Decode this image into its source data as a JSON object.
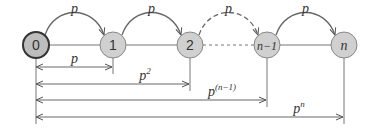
{
  "diagram": {
    "nodes": [
      {
        "id": "0",
        "label": "0",
        "x": 36,
        "y": 45,
        "fill": "#bdbdbd",
        "stroke": "#333333",
        "bold": true
      },
      {
        "id": "1",
        "label": "1",
        "x": 113,
        "y": 45,
        "fill": "#d0d0d0",
        "stroke": "#888888"
      },
      {
        "id": "2",
        "label": "2",
        "x": 190,
        "y": 45,
        "fill": "#d0d0d0",
        "stroke": "#888888"
      },
      {
        "id": "n-1",
        "label": "n−1",
        "x": 267,
        "y": 45,
        "fill": "#d0d0d0",
        "stroke": "#888888"
      },
      {
        "id": "n",
        "label": "n",
        "x": 344,
        "y": 45,
        "fill": "#d0d0d0",
        "stroke": "#888888"
      }
    ],
    "arcs": [
      {
        "from": "0",
        "to": "1",
        "label": "p",
        "dashed": false
      },
      {
        "from": "1",
        "to": "2",
        "label": "p",
        "dashed": false
      },
      {
        "from": "2",
        "to": "n-1",
        "label": "p",
        "dashed": true
      },
      {
        "from": "n-1",
        "to": "n",
        "label": "p",
        "dashed": false
      }
    ],
    "spans": [
      {
        "to": "1",
        "y": 67,
        "label": "p",
        "sup": ""
      },
      {
        "to": "2",
        "y": 84,
        "label": "p",
        "sup": "2"
      },
      {
        "to": "n-1",
        "y": 100,
        "label": "p",
        "sup": "(n−1)"
      },
      {
        "to": "n",
        "y": 117,
        "label": "p",
        "sup": "n"
      }
    ]
  }
}
